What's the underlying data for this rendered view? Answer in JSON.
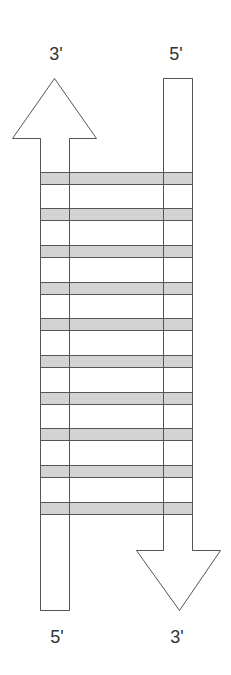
{
  "diagram": {
    "labels": {
      "top_left": "3'",
      "top_right": "5'",
      "bottom_left": "5'",
      "bottom_right": "3'"
    },
    "strands": [
      {
        "name": "left-strand",
        "direction": "up",
        "from": "5'",
        "to": "3'"
      },
      {
        "name": "right-strand",
        "direction": "down",
        "from": "5'",
        "to": "3'"
      }
    ],
    "rung_count": 10,
    "colors": {
      "rung_fill": "#d3d3d3",
      "outline": "#555555",
      "strand_fill": "#ffffff",
      "label": "#333333"
    }
  }
}
